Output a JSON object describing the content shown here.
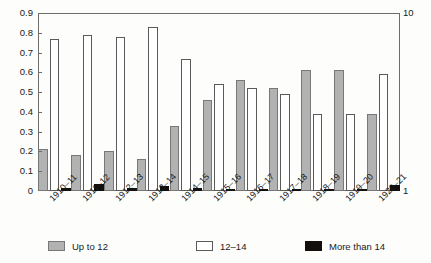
{
  "chart_data": {
    "type": "bar",
    "title": "",
    "xlabel": "",
    "ylabel": "",
    "grid": false,
    "legend_position": "bottom",
    "categories": [
      "1910–11",
      "1911–12",
      "1912–13",
      "1913–14",
      "1914–15",
      "1915–16",
      "1916–17",
      "1917–18",
      "1918–19",
      "1919–20",
      "1920–21"
    ],
    "ylim": [
      0,
      0.9
    ],
    "ytick_labels": [
      "0",
      "0.1",
      "0.2",
      "0.3",
      "0.4",
      "0.5",
      "0.6",
      "0.7",
      "0.8",
      "0.9"
    ],
    "ytick_values": [
      0,
      0.1,
      0.2,
      0.3,
      0.4,
      0.5,
      0.6,
      0.7,
      0.8,
      0.9
    ],
    "y2lim": [
      1,
      10
    ],
    "y2tick_labels": [
      "1",
      "10"
    ],
    "y2tick_values": [
      1,
      10
    ],
    "series": [
      {
        "name": "Up to 12",
        "color": "#b2b2b2",
        "values": [
          0.21,
          0.18,
          0.2,
          0.16,
          0.33,
          0.46,
          0.56,
          0.52,
          0.61,
          0.61,
          0.39
        ]
      },
      {
        "name": "12–14",
        "color": "#ffffff",
        "values": [
          0.77,
          0.79,
          0.78,
          0.83,
          0.67,
          0.54,
          0.52,
          0.49,
          0.39,
          0.39,
          0.59
        ]
      },
      {
        "name": "More than 14",
        "color": "#120f0d",
        "values": [
          0.015,
          0.035,
          0.015,
          0.025,
          0.015,
          0.01,
          0.01,
          0.01,
          0.01,
          0.01,
          0.03
        ]
      }
    ]
  },
  "legend": {
    "items": [
      {
        "label": "Up to 12"
      },
      {
        "label": "12–14"
      },
      {
        "label": "More than 14"
      }
    ]
  }
}
